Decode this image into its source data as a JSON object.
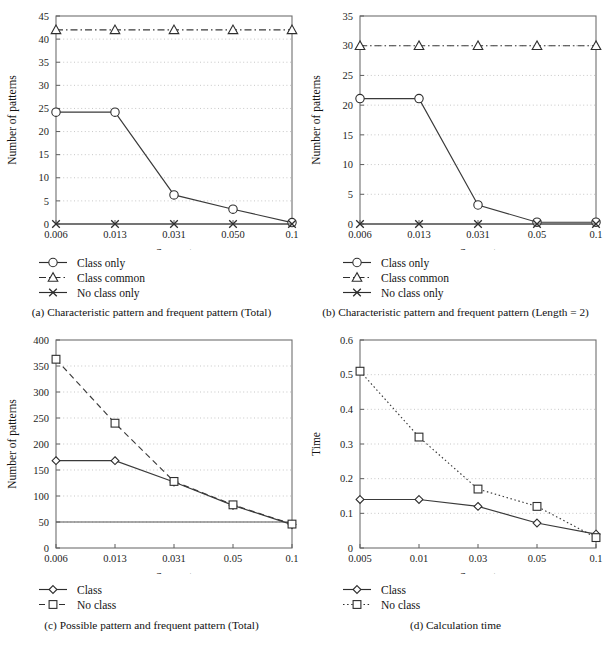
{
  "figure": {
    "panels": [
      "a",
      "b",
      "c",
      "d"
    ]
  },
  "chart_data": [
    {
      "id": "a",
      "type": "line",
      "title": "",
      "caption": "(a) Characteristic pattern and frequent pattern (Total)",
      "caption_tag": "(a)",
      "caption_text": "Characteristic pattern and frequent pattern (Total)",
      "xlabel": "Support",
      "ylabel": "Number of patterns",
      "categories": [
        "0.006",
        "0.013",
        "0.031",
        "0.050",
        "0.1"
      ],
      "x": [
        0.006,
        0.013,
        0.031,
        0.05,
        0.1
      ],
      "xtick_labels": [
        "0.006",
        "0.013",
        "0.031",
        "0.050",
        "0.1"
      ],
      "ytick_labels": [
        "0",
        "5",
        "10",
        "15",
        "20",
        "25",
        "30",
        "35",
        "40",
        "45"
      ],
      "yticks": [
        0,
        5,
        10,
        15,
        20,
        25,
        30,
        35,
        40,
        45
      ],
      "ylim": [
        0,
        45
      ],
      "grid": true,
      "legend_position": "below",
      "series": [
        {
          "name": "Class only",
          "marker": "circle",
          "dash": "solid",
          "values": [
            24.2,
            24.2,
            6.3,
            3.2,
            0.3
          ]
        },
        {
          "name": "Class common",
          "marker": "triangle",
          "dash": "dashdot",
          "values": [
            42,
            42,
            42,
            42,
            42
          ]
        },
        {
          "name": "No class only",
          "marker": "cross",
          "dash": "solid",
          "values": [
            0,
            0,
            0,
            0,
            0
          ]
        }
      ]
    },
    {
      "id": "b",
      "type": "line",
      "title": "",
      "caption": "(b) Characteristic pattern and frequent pattern (Length = 2)",
      "caption_tag": "(b)",
      "caption_text": "Characteristic pattern and frequent pattern (Length = 2)",
      "xlabel": "Support",
      "ylabel": "Number of patterns",
      "categories": [
        "0.006",
        "0.013",
        "0.031",
        "0.05",
        "0.1"
      ],
      "x": [
        0.006,
        0.013,
        0.031,
        0.05,
        0.1
      ],
      "xtick_labels": [
        "0.006",
        "0.013",
        "0.031",
        "0.05",
        "0.1"
      ],
      "ytick_labels": [
        "0",
        "5",
        "10",
        "15",
        "20",
        "25",
        "30",
        "35"
      ],
      "yticks": [
        0,
        5,
        10,
        15,
        20,
        25,
        30,
        35
      ],
      "ylim": [
        0,
        35
      ],
      "grid": true,
      "legend_position": "below",
      "series": [
        {
          "name": "Class only",
          "marker": "circle",
          "dash": "solid",
          "values": [
            21.1,
            21.1,
            3.2,
            0.3,
            0.3
          ]
        },
        {
          "name": "Class common",
          "marker": "triangle",
          "dash": "dashdot",
          "values": [
            30,
            30,
            30,
            30,
            30
          ]
        },
        {
          "name": "No class only",
          "marker": "cross",
          "dash": "solid",
          "values": [
            0,
            0,
            0,
            0,
            0
          ]
        }
      ]
    },
    {
      "id": "c",
      "type": "line",
      "title": "",
      "caption": "(c) Possible pattern and frequent pattern (Total)",
      "caption_tag": "(c)",
      "caption_text": "Possible pattern and frequent pattern (Total)",
      "xlabel": "Support",
      "ylabel": "Number of patterns",
      "categories": [
        "0.006",
        "0.013",
        "0.031",
        "0.05",
        "0.1"
      ],
      "x": [
        0.006,
        0.013,
        0.031,
        0.05,
        0.1
      ],
      "xtick_labels": [
        "0.006",
        "0.013",
        "0.031",
        "0.05",
        "0.1"
      ],
      "ytick_labels": [
        "0",
        "50",
        "100",
        "150",
        "200",
        "250",
        "300",
        "350",
        "400"
      ],
      "yticks": [
        0,
        50,
        100,
        150,
        200,
        250,
        300,
        350,
        400
      ],
      "ylim": [
        0,
        400
      ],
      "grid": true,
      "legend_position": "below",
      "series": [
        {
          "name": "Class",
          "marker": "diamond",
          "dash": "solid",
          "values": [
            168,
            168,
            127,
            82,
            45
          ]
        },
        {
          "name": "No class",
          "marker": "square",
          "dash": "dashed",
          "values": [
            363,
            240,
            128,
            83,
            46
          ]
        }
      ],
      "reference_line": 50
    },
    {
      "id": "d",
      "type": "line",
      "title": "",
      "caption": "(d) Calculation time",
      "caption_tag": "(d)",
      "caption_text": "Calculation time",
      "xlabel": "Support",
      "ylabel": "Time",
      "categories": [
        "0.005",
        "0.01",
        "0.03",
        "0.05",
        "0.1"
      ],
      "x": [
        0.005,
        0.01,
        0.03,
        0.05,
        0.1
      ],
      "xtick_labels": [
        "0.005",
        "0.01",
        "0.03",
        "0.05",
        "0.1"
      ],
      "ytick_labels": [
        "0",
        "0.1",
        "0.2",
        "0.3",
        "0.4",
        "0.5",
        "0.6"
      ],
      "yticks": [
        0,
        0.1,
        0.2,
        0.3,
        0.4,
        0.5,
        0.6
      ],
      "ylim": [
        0,
        0.6
      ],
      "grid": true,
      "legend_position": "below",
      "series": [
        {
          "name": "Class",
          "marker": "diamond",
          "dash": "solid",
          "values": [
            0.14,
            0.14,
            0.12,
            0.072,
            0.04
          ]
        },
        {
          "name": "No class",
          "marker": "square",
          "dash": "dotted",
          "values": [
            0.51,
            0.32,
            0.17,
            0.12,
            0.03
          ]
        }
      ]
    }
  ]
}
